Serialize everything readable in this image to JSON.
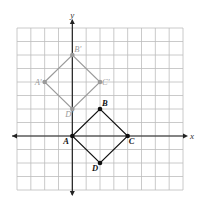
{
  "figure": {
    "axes": {
      "x_label": "x",
      "y_label": "y",
      "x_range": [
        -4,
        8
      ],
      "y_range": [
        -4,
        8
      ],
      "grid": true
    },
    "original": {
      "name": "ABCD",
      "color": "#111111",
      "points": [
        {
          "label": "A",
          "x": 0,
          "y": 0
        },
        {
          "label": "B",
          "x": 2,
          "y": 2
        },
        {
          "label": "C",
          "x": 4,
          "y": 0
        },
        {
          "label": "D",
          "x": 2,
          "y": -2
        }
      ]
    },
    "image": {
      "name": "A'B'C'D'",
      "color": "#9a9a9a",
      "points": [
        {
          "label": "A'",
          "x": -2,
          "y": 4
        },
        {
          "label": "B'",
          "x": 0,
          "y": 6
        },
        {
          "label": "C'",
          "x": 2,
          "y": 4
        },
        {
          "label": "D'",
          "x": 0,
          "y": 2
        }
      ]
    }
  }
}
